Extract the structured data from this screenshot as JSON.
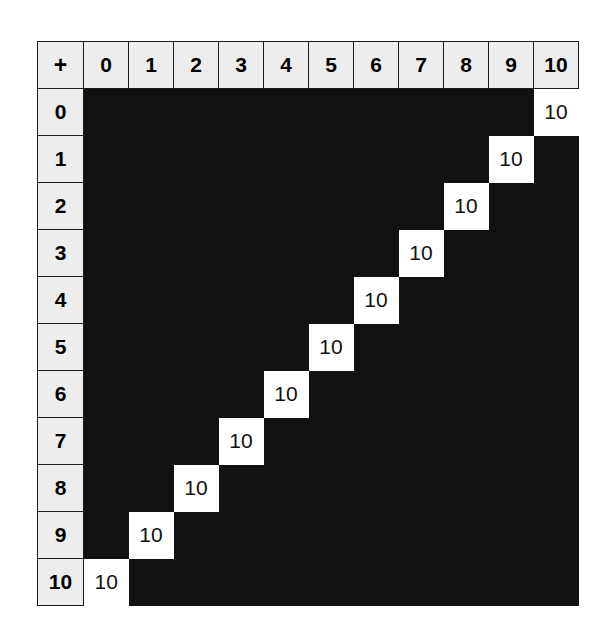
{
  "table": {
    "corner_label": "+",
    "column_headers": [
      "0",
      "1",
      "2",
      "3",
      "4",
      "5",
      "6",
      "7",
      "8",
      "9",
      "10"
    ],
    "row_headers": [
      "0",
      "1",
      "2",
      "3",
      "4",
      "5",
      "6",
      "7",
      "8",
      "9",
      "10"
    ],
    "filled_value": "10",
    "empty_value": "",
    "colors": {
      "header_background": "#ededed",
      "header_text": "#000000",
      "cell_background_empty": "#111111",
      "cell_background_filled": "#ffffff",
      "cell_text_filled": "#111111",
      "border": "#1b1b1b",
      "page_background": "#ffffff"
    },
    "rows": [
      {
        "header": "0",
        "cells": [
          "",
          "",
          "",
          "",
          "",
          "",
          "",
          "",
          "",
          "",
          "10"
        ]
      },
      {
        "header": "1",
        "cells": [
          "",
          "",
          "",
          "",
          "",
          "",
          "",
          "",
          "",
          "10",
          ""
        ]
      },
      {
        "header": "2",
        "cells": [
          "",
          "",
          "",
          "",
          "",
          "",
          "",
          "",
          "10",
          "",
          ""
        ]
      },
      {
        "header": "3",
        "cells": [
          "",
          "",
          "",
          "",
          "",
          "",
          "",
          "10",
          "",
          "",
          ""
        ]
      },
      {
        "header": "4",
        "cells": [
          "",
          "",
          "",
          "",
          "",
          "",
          "10",
          "",
          "",
          "",
          ""
        ]
      },
      {
        "header": "5",
        "cells": [
          "",
          "",
          "",
          "",
          "",
          "10",
          "",
          "",
          "",
          "",
          ""
        ]
      },
      {
        "header": "6",
        "cells": [
          "",
          "",
          "",
          "",
          "10",
          "",
          "",
          "",
          "",
          "",
          ""
        ]
      },
      {
        "header": "7",
        "cells": [
          "",
          "",
          "",
          "10",
          "",
          "",
          "",
          "",
          "",
          "",
          ""
        ]
      },
      {
        "header": "8",
        "cells": [
          "",
          "",
          "10",
          "",
          "",
          "",
          "",
          "",
          "",
          "",
          ""
        ]
      },
      {
        "header": "9",
        "cells": [
          "",
          "10",
          "",
          "",
          "",
          "",
          "",
          "",
          "",
          "",
          ""
        ]
      },
      {
        "header": "10",
        "cells": [
          "10",
          "",
          "",
          "",
          "",
          "",
          "",
          "",
          "",
          "",
          ""
        ]
      }
    ]
  }
}
